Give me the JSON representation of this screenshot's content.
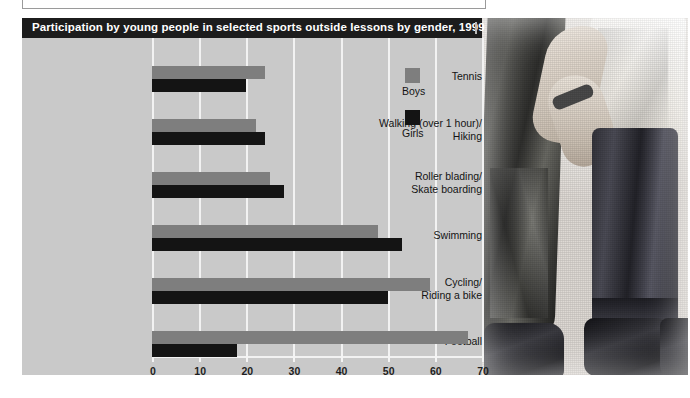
{
  "figure": {
    "title": "Participation by young people in selected sports outside lessons by gender, 1999"
  },
  "legend": {
    "entries": [
      {
        "label": "Boys",
        "color": "#7e7e7e"
      },
      {
        "label": "Girls",
        "color": "#141414"
      }
    ]
  },
  "axis": {
    "ticks": [
      "0",
      "10",
      "20",
      "30",
      "40",
      "50",
      "60",
      "70"
    ]
  },
  "categories_display": [
    "Tennis",
    "Walking (over 1 hour)/\nHiking",
    "Roller blading/\nSkate boarding",
    "Swimming",
    "Cycling/\nRiding a bike",
    "Football"
  ],
  "chart_data": {
    "type": "bar",
    "orientation": "horizontal",
    "title": "Participation by young people in selected sports outside lessons by gender, 1999",
    "xlabel": "",
    "ylabel": "",
    "xlim": [
      0,
      70
    ],
    "xticks": [
      0,
      10,
      20,
      30,
      40,
      50,
      60,
      70
    ],
    "grid": true,
    "legend_position": "inside-right",
    "categories": [
      "Tennis",
      "Walking (over 1 hour)/Hiking",
      "Roller blading/Skate boarding",
      "Swimming",
      "Cycling/Riding a bike",
      "Football"
    ],
    "series": [
      {
        "name": "Boys",
        "color": "#7e7e7e",
        "values": [
          24,
          22,
          25,
          48,
          59,
          67
        ]
      },
      {
        "name": "Girls",
        "color": "#141414",
        "values": [
          20,
          24,
          28,
          53,
          50,
          18
        ]
      }
    ]
  }
}
